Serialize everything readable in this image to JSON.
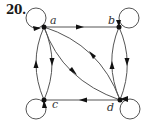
{
  "problem_number": "20.",
  "colors": {
    "edge": "#555555",
    "node": "#111111",
    "arrow": "#111111",
    "background": "#ffffff"
  },
  "graph": {
    "type": "directed",
    "nodes": [
      {
        "id": "a",
        "label": "a",
        "x": 44,
        "y": 27
      },
      {
        "id": "b",
        "label": "b",
        "x": 119,
        "y": 27
      },
      {
        "id": "c",
        "label": "c",
        "x": 44,
        "y": 100
      },
      {
        "id": "d",
        "label": "d",
        "x": 120,
        "y": 100
      }
    ],
    "edges": [
      {
        "from": "a",
        "to": "a",
        "kind": "loop"
      },
      {
        "from": "b",
        "to": "b",
        "kind": "loop"
      },
      {
        "from": "c",
        "to": "c",
        "kind": "loop"
      },
      {
        "from": "d",
        "to": "d",
        "kind": "loop"
      },
      {
        "from": "a",
        "to": "b",
        "kind": "straight"
      },
      {
        "from": "d",
        "to": "c",
        "kind": "straight"
      },
      {
        "from": "a",
        "to": "c",
        "kind": "curved"
      },
      {
        "from": "c",
        "to": "a",
        "kind": "curved"
      },
      {
        "from": "b",
        "to": "d",
        "kind": "curved"
      },
      {
        "from": "d",
        "to": "b",
        "kind": "curved"
      },
      {
        "from": "a",
        "to": "d",
        "kind": "curved"
      },
      {
        "from": "d",
        "to": "a",
        "kind": "curved"
      }
    ]
  }
}
